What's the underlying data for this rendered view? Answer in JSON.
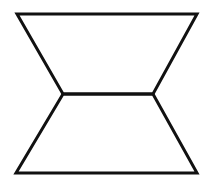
{
  "diagram": {
    "type": "line-figure",
    "stroke_color": "#111111",
    "background": "#ffffff",
    "stroke_width": 3,
    "vertices": {
      "top_left": [
        17,
        14
      ],
      "top_right": [
        197,
        14
      ],
      "mid_left": [
        63,
        94
      ],
      "mid_right": [
        153,
        94
      ],
      "bottom_left": [
        16,
        173
      ],
      "bottom_right": [
        197,
        173
      ]
    },
    "shapes": [
      {
        "name": "upper-trapezoid",
        "points": "17,14 197,14 153,94 63,94"
      },
      {
        "name": "lower-trapezoid",
        "points": "63,94 153,94 197,173 16,173"
      }
    ]
  }
}
